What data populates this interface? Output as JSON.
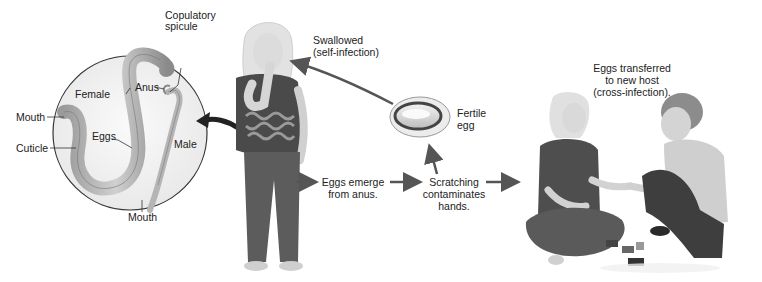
{
  "worm_inset": {
    "labels": {
      "copulatory_spicule": [
        "Copulatory",
        "spicule"
      ],
      "female": "Female",
      "anus": "Anus",
      "mouth_female": "Mouth",
      "eggs": "Eggs",
      "male": "Male",
      "cuticle": "Cuticle",
      "mouth_male": "Mouth"
    }
  },
  "cycle": {
    "swallowed": [
      "Swallowed",
      "(self-infection)"
    ],
    "fertile_egg": [
      "Fertile",
      "egg"
    ],
    "eggs_emerge": [
      "Eggs emerge",
      "from anus."
    ],
    "scratching": [
      "Scratching",
      "contaminates",
      "hands."
    ],
    "transferred": [
      "Eggs transferred",
      "to new host",
      "(cross-infection)."
    ]
  },
  "colors": {
    "text": "#222222",
    "arrow": "#555555",
    "inset_fill": "#f1f1f1",
    "worm": "#b9b9b9",
    "shirt": "#4a4a4a",
    "jeans": "#5c5c5c",
    "skin": "#d8d8d8",
    "hair": "#e4e4e4"
  }
}
